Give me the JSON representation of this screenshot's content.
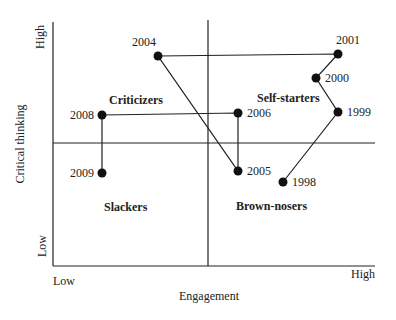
{
  "chart_data": {
    "type": "scatter",
    "title": "",
    "xlabel": "Engagement",
    "ylabel": "Critical thinking",
    "x_ticks": {
      "low": "Low",
      "high": "High"
    },
    "y_ticks": {
      "low": "Low",
      "high": "High"
    },
    "xlim": [
      0,
      10
    ],
    "ylim": [
      0,
      10
    ],
    "quadrant_dividers": {
      "x": 5,
      "y": 5
    },
    "grid": false,
    "connected": true,
    "quadrants": [
      {
        "label": "Criticizers",
        "x": 3.1,
        "y": 6.6
      },
      {
        "label": "Self-starters",
        "x": 7.3,
        "y": 6.1
      },
      {
        "label": "Slackers",
        "x": 2.6,
        "y": 2.4
      },
      {
        "label": "Brown-nosers",
        "x": 6.8,
        "y": 2.4
      }
    ],
    "series": [
      {
        "name": "Trajectory",
        "points": [
          {
            "label": "1998",
            "x": 7.1,
            "y": 3.5
          },
          {
            "label": "1999",
            "x": 8.8,
            "y": 6.3
          },
          {
            "label": "2000",
            "x": 8.1,
            "y": 7.7
          },
          {
            "label": "2001",
            "x": 8.8,
            "y": 8.7
          },
          {
            "label": "2004",
            "x": 3.3,
            "y": 8.6
          },
          {
            "label": "2005",
            "x": 5.9,
            "y": 3.9
          },
          {
            "label": "2006",
            "x": 5.9,
            "y": 6.3
          },
          {
            "label": "2008",
            "x": 1.6,
            "y": 6.2
          },
          {
            "label": "2009",
            "x": 1.6,
            "y": 3.8
          }
        ]
      }
    ]
  }
}
